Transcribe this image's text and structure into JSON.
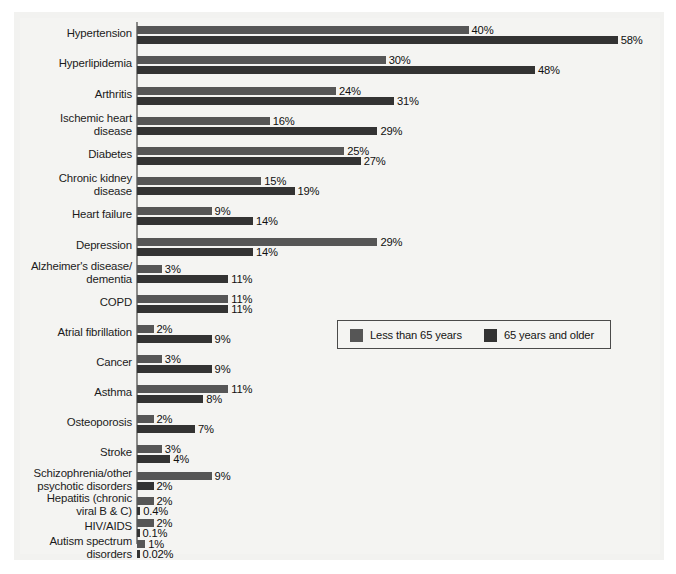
{
  "chart_data": {
    "type": "bar",
    "orientation": "horizontal",
    "title": "",
    "xlabel": "",
    "ylabel": "",
    "xlim": [
      0,
      60
    ],
    "grid": false,
    "legend_position": "middle-right",
    "value_suffix": "%",
    "series": [
      {
        "name": "Less than 65 years",
        "color": "#565656",
        "values": [
          40,
          30,
          24,
          16,
          25,
          15,
          9,
          29,
          3,
          11,
          2,
          3,
          11,
          2,
          3,
          9,
          2,
          2,
          1
        ],
        "labels": [
          "40%",
          "30%",
          "24%",
          "16%",
          "25%",
          "15%",
          "9%",
          "29%",
          "3%",
          "11%",
          "2%",
          "3%",
          "11%",
          "2%",
          "3%",
          "9%",
          "2%",
          "2%",
          "1%"
        ]
      },
      {
        "name": "65 years and older",
        "color": "#333333",
        "values": [
          58,
          48,
          31,
          29,
          27,
          19,
          14,
          14,
          11,
          11,
          9,
          9,
          8,
          7,
          4,
          2,
          0.4,
          0.1,
          0.02
        ],
        "labels": [
          "58%",
          "48%",
          "31%",
          "29%",
          "27%",
          "19%",
          "14%",
          "14%",
          "11%",
          "11%",
          "9%",
          "9%",
          "8%",
          "7%",
          "4%",
          "2%",
          "0.4%",
          "0.1%",
          "0.02%"
        ]
      }
    ],
    "categories": [
      "Hypertension",
      "Hyperlipidemia",
      "Arthritis",
      "Ischemic heart\ndisease",
      "Diabetes",
      "Chronic kidney\ndisease",
      "Heart failure",
      "Depression",
      "Alzheimer's disease/\ndementia",
      "COPD",
      "Atrial fibrillation",
      "Cancer",
      "Asthma",
      "Osteoporosis",
      "Stroke",
      "Schizophrenia/other\npsychotic disorders",
      "Hepatitis (chronic\nviral B & C)",
      "HIV/AIDS",
      "Autism spectrum\ndisorders"
    ]
  },
  "legend": {
    "items": [
      {
        "label": "Less than 65 years",
        "color": "#565656"
      },
      {
        "label": "65 years and older",
        "color": "#333333"
      }
    ]
  }
}
